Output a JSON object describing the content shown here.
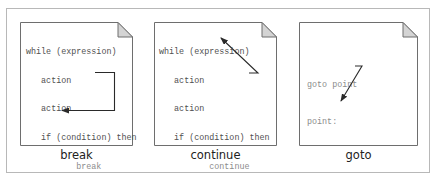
{
  "panels": [
    {
      "id": "break",
      "caption": "break",
      "lines": [
        {
          "indent": 0,
          "text": "while (expression)",
          "highlight": false
        },
        {
          "indent": 1,
          "text": "action",
          "highlight": false
        },
        {
          "indent": 1,
          "text": "action",
          "highlight": false
        },
        {
          "indent": 1,
          "text": "if (condition) then",
          "highlight": false
        },
        {
          "indent": 2,
          "text": "break",
          "highlight": true
        },
        {
          "indent": 1,
          "text": "endif",
          "highlight": false
        },
        {
          "indent": 1,
          "text": "action",
          "highlight": false
        },
        {
          "indent": 1,
          "text": "action",
          "highlight": false
        },
        {
          "indent": 0,
          "text": "end",
          "highlight": false
        },
        {
          "indent": 0,
          "text": "action",
          "highlight": false
        },
        {
          "indent": 0,
          "text": "action",
          "highlight": false
        }
      ],
      "arrow": "from 'break' jumps to the line after 'end'"
    },
    {
      "id": "continue",
      "caption": "continue",
      "lines": [
        {
          "indent": 0,
          "text": "while (expression)",
          "highlight": false
        },
        {
          "indent": 1,
          "text": "action",
          "highlight": false
        },
        {
          "indent": 1,
          "text": "action",
          "highlight": false
        },
        {
          "indent": 1,
          "text": "if (condition) then",
          "highlight": false
        },
        {
          "indent": 2,
          "text": "continue",
          "highlight": true
        },
        {
          "indent": 1,
          "text": "endif",
          "highlight": false
        },
        {
          "indent": 1,
          "text": "action",
          "highlight": false
        },
        {
          "indent": 1,
          "text": "action",
          "highlight": false
        },
        {
          "indent": 0,
          "text": "end",
          "highlight": false
        },
        {
          "indent": 0,
          "text": "action",
          "highlight": false
        },
        {
          "indent": 0,
          "text": "action",
          "highlight": false
        }
      ],
      "arrow": "from 'continue' back up to 'while (expression)'"
    },
    {
      "id": "goto",
      "caption": "goto",
      "lines": [
        {
          "text": "goto point",
          "highlight": true
        },
        {
          "text": "point:",
          "highlight": true
        }
      ],
      "arrow": "from 'goto point' down to 'point:'"
    }
  ],
  "colors": {
    "code_text": "#505050",
    "highlight_text": "#8c8c8c",
    "page_border": "#6e6e6e",
    "fold_fill": "#d4d4d4",
    "arrow": "#2a2a2a",
    "frame_border": "#b8b8b8"
  }
}
